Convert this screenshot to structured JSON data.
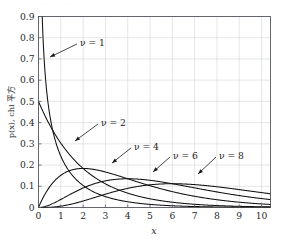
{
  "figure": {
    "faint_top_artifact": "·· ··· ···· ··· ··",
    "background_color": "#ffffff",
    "curve_color": "#111111",
    "grid_color": "#d3d5d8",
    "axis_color": "#555a5e"
  },
  "chart_data": {
    "type": "line",
    "title": "",
    "subtitle": "",
    "xlabel": "x",
    "ylabel": "p(x), chi 平方",
    "xlim": [
      0,
      10.4
    ],
    "ylim": [
      0,
      0.9
    ],
    "xticks": [
      0,
      1,
      2,
      3,
      4,
      5,
      6,
      7,
      8,
      9,
      10
    ],
    "xticklabels": [
      "0",
      "1",
      "2",
      "3",
      "4",
      "5",
      "6",
      "7",
      "8",
      "9",
      "10"
    ],
    "yticks": [
      0,
      0.1,
      0.2,
      0.3,
      0.4,
      0.5,
      0.6,
      0.7,
      0.8,
      0.9
    ],
    "yticklabels": [
      "0",
      "0.1",
      "0.2",
      "0.3",
      "0.4",
      "0.5",
      "0.6",
      "0.7",
      "0.8",
      "0.9"
    ],
    "grid": true,
    "legend": "annotations-inline",
    "legend_position": "inline",
    "distribution": "chi-squared probability density function",
    "series": [
      {
        "name": "nu = 1",
        "annotation": "ν = 1",
        "dof": 1,
        "x": [
          0.1,
          0.2,
          0.3,
          0.4,
          0.5,
          0.75,
          1.0,
          1.25,
          1.5,
          2.0,
          2.5,
          3.0,
          3.5,
          4.0,
          5.0,
          6.0,
          7.0,
          8.0,
          9.0,
          10.0
        ],
        "values": [
          1.2,
          0.807,
          0.628,
          0.516,
          0.439,
          0.323,
          0.242,
          0.187,
          0.146,
          0.0915,
          0.0584,
          0.038,
          0.025,
          0.0166,
          0.0076,
          0.0036,
          0.0017,
          0.00085,
          0.00042,
          0.00021
        ]
      },
      {
        "name": "nu = 2",
        "annotation": "ν = 2",
        "dof": 2,
        "x": [
          0,
          0.5,
          1.0,
          1.5,
          2.0,
          2.5,
          3.0,
          3.5,
          4.0,
          5.0,
          6.0,
          7.0,
          8.0,
          9.0,
          10.0
        ],
        "values": [
          0.5,
          0.389,
          0.303,
          0.236,
          0.184,
          0.143,
          0.112,
          0.087,
          0.068,
          0.041,
          0.025,
          0.015,
          0.0092,
          0.0056,
          0.0034
        ]
      },
      {
        "name": "nu = 4",
        "annotation": "ν = 4",
        "dof": 4,
        "x": [
          0,
          0.5,
          1.0,
          1.5,
          2.0,
          2.5,
          3.0,
          3.5,
          4.0,
          5.0,
          6.0,
          7.0,
          8.0,
          9.0,
          10.0
        ],
        "values": [
          0,
          0.0973,
          0.1516,
          0.1771,
          0.1839,
          0.1791,
          0.1673,
          0.1521,
          0.1353,
          0.1026,
          0.0747,
          0.0529,
          0.0366,
          0.025,
          0.0168
        ]
      },
      {
        "name": "nu = 6",
        "annotation": "ν = 6",
        "dof": 6,
        "x": [
          0,
          1.0,
          2.0,
          3.0,
          4.0,
          5.0,
          6.0,
          7.0,
          8.0,
          9.0,
          10.0
        ],
        "values": [
          0,
          0.0379,
          0.092,
          0.1255,
          0.1353,
          0.1283,
          0.112,
          0.0925,
          0.0733,
          0.0563,
          0.0421
        ]
      },
      {
        "name": "nu = 8",
        "annotation": "ν = 8",
        "dof": 8,
        "x": [
          0,
          1.0,
          2.0,
          3.0,
          4.0,
          5.0,
          6.0,
          7.0,
          8.0,
          9.0,
          10.0
        ],
        "values": [
          0,
          0.0076,
          0.0307,
          0.0627,
          0.0902,
          0.1069,
          0.112,
          0.1079,
          0.0977,
          0.0844,
          0.0702
        ]
      }
    ],
    "annotations": [
      {
        "label": "ν = 1",
        "text_x": 80,
        "text_y": 42,
        "tip_x": 50,
        "tip_y": 57
      },
      {
        "label": "ν = 2",
        "text_x": 101,
        "text_y": 122,
        "tip_x": 75,
        "tip_y": 141
      },
      {
        "label": "ν = 4",
        "text_x": 134,
        "text_y": 146,
        "tip_x": 112,
        "tip_y": 163
      },
      {
        "label": "ν = 6",
        "text_x": 173,
        "text_y": 155,
        "tip_x": 153,
        "tip_y": 172
      },
      {
        "label": "ν = 8",
        "text_x": 219,
        "text_y": 155,
        "tip_x": 198,
        "tip_y": 174
      }
    ]
  }
}
